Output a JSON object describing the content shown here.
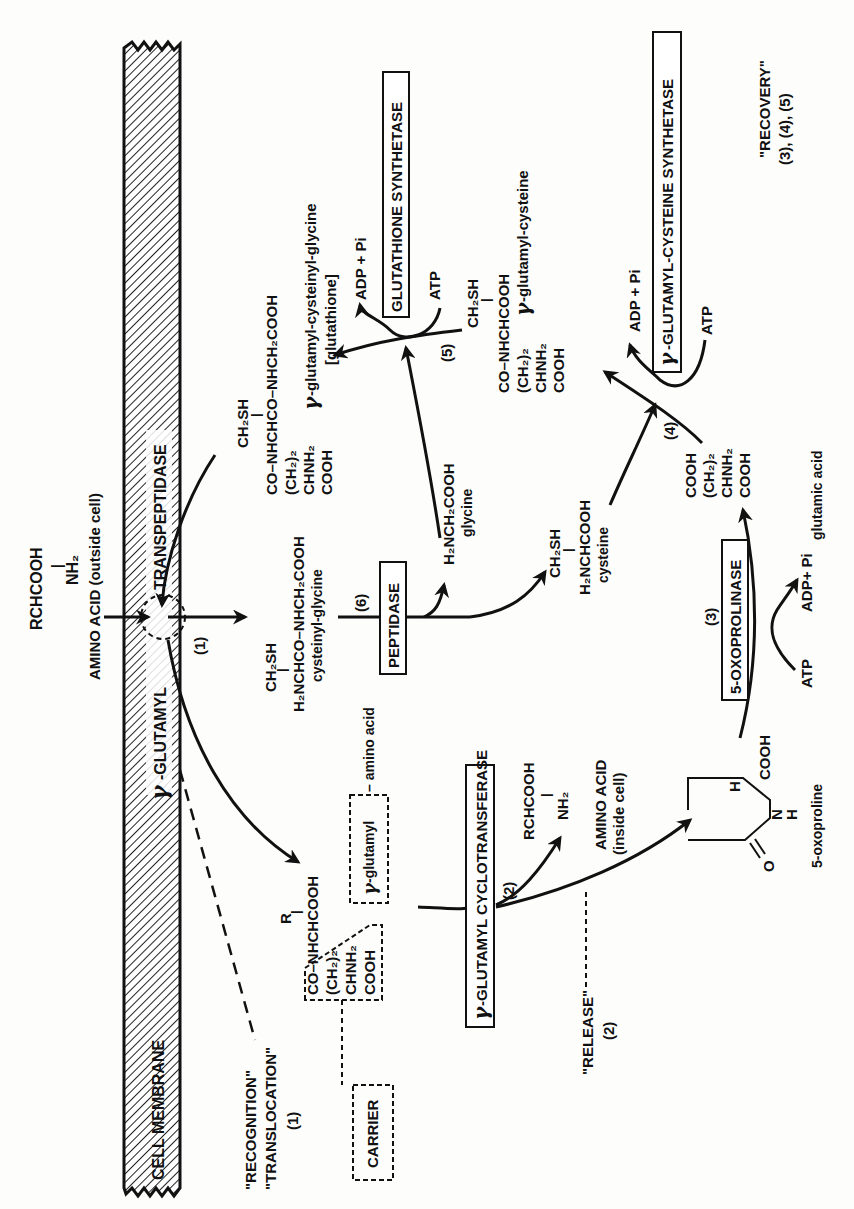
{
  "diagram": {
    "colors": {
      "ink": "#111111",
      "paper": "#fdfdfc"
    },
    "membrane": {
      "label": "CELL MEMBRANE",
      "enzyme_prefix": "γ",
      "enzyme_label": "-GLUTAMYL",
      "enzyme_label_2": "TRANSPEPTIDASE",
      "step": "(1)"
    },
    "outside": {
      "formula_top": "RCHCOOH",
      "formula_bond": "|",
      "formula_bottom": "NH₂",
      "label": "AMINO ACID (outside cell)"
    },
    "glutathione_top": {
      "sh": "CH₂SH",
      "bond": "|",
      "line1": "CO–NHCHCO–NHCH₂COOH",
      "line2": "(CH₂)₂",
      "line3": "CHNH₂",
      "line4": "COOH"
    },
    "glutathione_product": {
      "gamma": "γ",
      "name": "-glutamyl-cysteinyl-glycine",
      "bracket": "[glutathione]"
    },
    "glutathione_synthetase": {
      "label": "GLUTATHIONE SYNTHETASE",
      "adp": "ADP + Pi",
      "atp": "ATP",
      "step": "(5)"
    },
    "glu_cys": {
      "sh": "CH₂SH",
      "bond": "|",
      "line1": "CO–NHCHCOOH",
      "line2": "(CH₂)₂",
      "line3": "CHNH₂",
      "line4": "COOH",
      "gamma": "γ",
      "name": "-glutamyl-cysteine"
    },
    "glu_cys_synthetase": {
      "gamma": "γ",
      "label": "-GLUTAMYL-CYSTEINE SYNTHETASE",
      "adp": "ADP + Pi",
      "atp": "ATP",
      "step": "(4)"
    },
    "recovery": {
      "label": "\"RECOVERY\"",
      "steps": "(3), (4), (5)"
    },
    "cysteinyl_glycine": {
      "sh": "CH₂SH",
      "bond": "|",
      "formula": "H₂NCHCO–NHCH₂COOH",
      "name": "cysteinyl-glycine"
    },
    "peptidase": {
      "label": "PEPTIDASE",
      "step": "(6)"
    },
    "glycine": {
      "formula": "H₂NCH₂COOH",
      "name": "glycine"
    },
    "cysteine": {
      "sh": "CH₂SH",
      "bond": "|",
      "formula": "H₂NCHCOOH",
      "name": "cysteine"
    },
    "glutamic_acid": {
      "line1": "COOH",
      "line2": "(CH₂)₂",
      "line3": "CHNH₂",
      "line4": "COOH",
      "name": "glutamic acid"
    },
    "oxoprolinase": {
      "label": "5-OXOPROLINASE",
      "step": "(3)",
      "atp": "ATP",
      "adp": "ADP+ Pi"
    },
    "oxoproline": {
      "h": "H",
      "cooh": "COOH",
      "n": "N",
      "nh": "H",
      "o": "O",
      "name": "5-oxoproline"
    },
    "glutamyl_amino_acid": {
      "r": "R",
      "bond": "|",
      "line1": "CO–NHCHCOOH",
      "line2": "(CH₂)₂",
      "line3": "CHNH₂",
      "line4": "COOH",
      "gamma": "γ",
      "name_box": "-glutamyl",
      "name_rest": "– amino acid"
    },
    "cyclotransferase": {
      "gamma": "γ",
      "label": "-GLUTAMYL CYCLOTRANSFERASE",
      "step": "(2)"
    },
    "inside": {
      "formula_top": "RCHCOOH",
      "formula_bond": "|",
      "formula_bottom": "NH₂",
      "label": "AMINO ACID",
      "label2": "(inside cell)"
    },
    "carrier": {
      "label": "CARRIER"
    },
    "recognition": {
      "line1": "\"RECOGNITION\"",
      "line2": "\"TRANSLOCATION\"",
      "step": "(1)"
    },
    "release": {
      "label": "\"RELEASE\"",
      "step": "(2)"
    }
  }
}
